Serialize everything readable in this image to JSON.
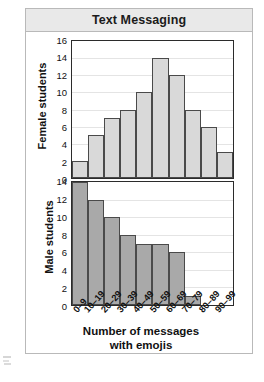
{
  "figure": {
    "title": "Text Messaging",
    "frequency_axis_label": "Frequency",
    "x_axis_title_line1": "Number of messages",
    "x_axis_title_line2": "with emojis",
    "female_panel_label": "Female students",
    "male_panel_label": "Male students",
    "colors": {
      "title_band": "#e9e9e9",
      "female_bar_fill": "#d9d9d9",
      "male_bar_fill": "#a9a9a9",
      "bar_outline": "#4a4a4a",
      "axis": "#2b2b2b",
      "gridline": "#e4e4e4"
    }
  },
  "chart_data": {
    "type": "bar",
    "title": "Text Messaging",
    "xlabel": "Number of messages with emojis",
    "ylabel": "Frequency",
    "grid": true,
    "legend_position": "none",
    "categories": [
      "0–9",
      "10–19",
      "20–29",
      "30–39",
      "40–49",
      "50–59",
      "60–69",
      "70–79",
      "80–89",
      "90–99"
    ],
    "panels": [
      {
        "name": "Female students",
        "ylim": [
          0,
          16
        ],
        "yticks": [
          16,
          14,
          12,
          10,
          8,
          6,
          4,
          2,
          0
        ],
        "values": [
          2,
          5,
          7,
          8,
          10,
          14,
          12,
          8,
          6,
          3
        ]
      },
      {
        "name": "Male students",
        "ylim": [
          0,
          14
        ],
        "yticks": [
          14,
          12,
          10,
          8,
          6,
          4,
          2,
          0
        ],
        "values": [
          14,
          12,
          10,
          8,
          7,
          7,
          6,
          1,
          0,
          0
        ]
      }
    ]
  }
}
